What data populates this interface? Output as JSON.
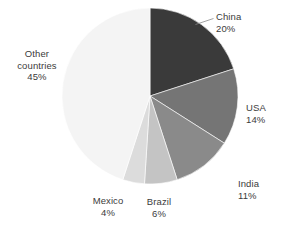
{
  "chart_data": {
    "type": "pie",
    "title": "",
    "subtitle": "",
    "xlabel": "",
    "ylabel": "",
    "legend_position": "none",
    "grid": false,
    "labels_position": "outside",
    "start_angle_deg": 0,
    "direction": "clockwise",
    "units": "percent",
    "total": 100,
    "categories": [
      "China",
      "USA",
      "India",
      "Brazil",
      "Mexico",
      "Other countries"
    ],
    "values": [
      20,
      14,
      11,
      6,
      4,
      45
    ],
    "slices": [
      {
        "label": "China",
        "label_line1": "China",
        "label_line2": "countries",
        "value": 20,
        "value_text": "20%",
        "color": "#3a3a3a",
        "has_leader_line": true
      },
      {
        "label": "USA",
        "label_line1": "USA",
        "value": 14,
        "value_text": "14%",
        "color": "#757575",
        "has_leader_line": false
      },
      {
        "label": "India",
        "label_line1": "India",
        "value": 11,
        "value_text": "11%",
        "color": "#8a8a8a",
        "has_leader_line": false
      },
      {
        "label": "Brazil",
        "label_line1": "Brazil",
        "value": 6,
        "value_text": "6%",
        "color": "#c4c4c4",
        "has_leader_line": false
      },
      {
        "label": "Mexico",
        "label_line1": "Mexico",
        "value": 4,
        "value_text": "4%",
        "color": "#dcdcdc",
        "has_leader_line": false
      },
      {
        "label": "Other countries",
        "label_line1": "Other",
        "label_line2": "countries",
        "value": 45,
        "value_text": "45%",
        "color": "#f4f4f4",
        "has_leader_line": false
      }
    ]
  },
  "labels": {
    "china": {
      "name": "China",
      "pct": "20%"
    },
    "usa": {
      "name": "USA",
      "pct": "14%"
    },
    "india": {
      "name": "India",
      "pct": "11%"
    },
    "brazil": {
      "name": "Brazil",
      "pct": "6%"
    },
    "mexico": {
      "name": "Mexico",
      "pct": "4%"
    },
    "other": {
      "line1": "Other",
      "line2": "countries",
      "pct": "45%"
    }
  },
  "geometry": {
    "center_x": 150,
    "center_y": 96,
    "radius": 88
  },
  "colors": {
    "background": "#ffffff",
    "text": "#3b3b3b",
    "leader_line": "#8a8a8a",
    "slice_border": "#ffffff"
  }
}
